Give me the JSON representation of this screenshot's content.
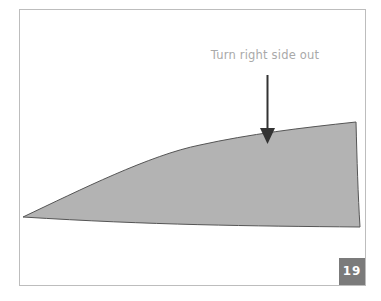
{
  "figure": {
    "annotation": "Turn right side out",
    "step_number": "19",
    "colors": {
      "frame_border": "#bdbdbd",
      "shape_fill": "#b3b3b3",
      "shape_outline": "#555555",
      "arrow": "#333333",
      "annotation_text": "#a9a9a9",
      "badge_bg": "#7b7b7b",
      "badge_text": "#ffffff"
    }
  }
}
